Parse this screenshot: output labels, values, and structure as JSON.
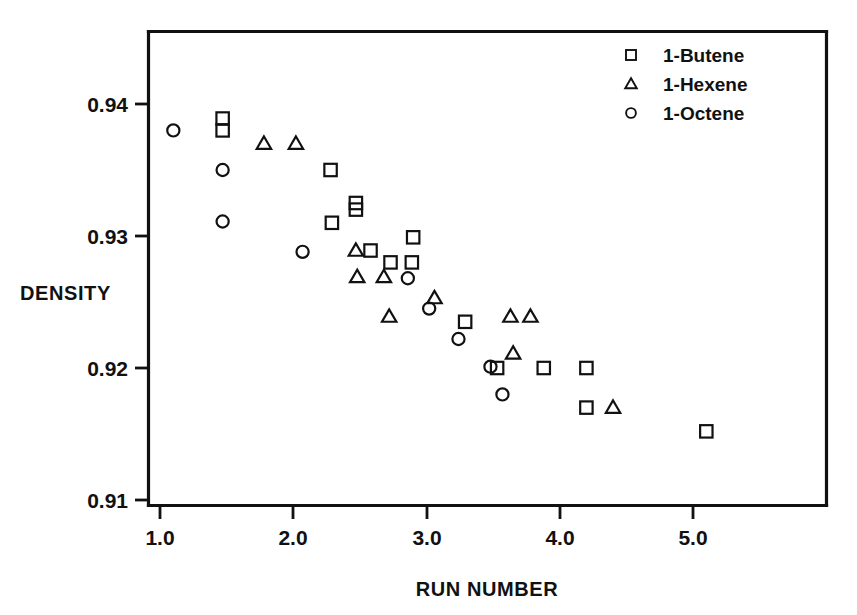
{
  "chart_data": {
    "type": "scatter",
    "title": "",
    "xlabel": "RUN NUMBER",
    "ylabel": "DENSITY",
    "xlim": [
      0.88,
      5.95
    ],
    "ylim": [
      0.9055,
      0.9425
    ],
    "xticks": [
      "1.0",
      "2.0",
      "3.0",
      "4.0",
      "5.0"
    ],
    "xtick_values": [
      1.0,
      2.0,
      3.0,
      4.0,
      5.0
    ],
    "yticks": [
      "0.94",
      "0.93",
      "0.92",
      "0.91"
    ],
    "ytick_values": [
      0.94,
      0.93,
      0.92,
      0.91
    ],
    "grid": false,
    "legend_position": "top-right",
    "series": [
      {
        "name": "1-Butene",
        "marker": "square",
        "points": [
          {
            "x": 1.47,
            "y": 0.9389
          },
          {
            "x": 1.47,
            "y": 0.938
          },
          {
            "x": 2.28,
            "y": 0.935
          },
          {
            "x": 2.29,
            "y": 0.931
          },
          {
            "x": 2.47,
            "y": 0.9325
          },
          {
            "x": 2.47,
            "y": 0.932
          },
          {
            "x": 2.58,
            "y": 0.9289
          },
          {
            "x": 2.73,
            "y": 0.928
          },
          {
            "x": 2.9,
            "y": 0.9299
          },
          {
            "x": 2.89,
            "y": 0.928
          },
          {
            "x": 3.29,
            "y": 0.9235
          },
          {
            "x": 3.53,
            "y": 0.92
          },
          {
            "x": 3.88,
            "y": 0.92
          },
          {
            "x": 4.2,
            "y": 0.92
          },
          {
            "x": 4.2,
            "y": 0.917
          },
          {
            "x": 5.1,
            "y": 0.9152
          }
        ]
      },
      {
        "name": "1-Hexene",
        "marker": "triangle",
        "points": [
          {
            "x": 1.78,
            "y": 0.937
          },
          {
            "x": 2.02,
            "y": 0.937
          },
          {
            "x": 2.47,
            "y": 0.9289
          },
          {
            "x": 2.48,
            "y": 0.9269
          },
          {
            "x": 2.68,
            "y": 0.9269
          },
          {
            "x": 2.72,
            "y": 0.9239
          },
          {
            "x": 3.06,
            "y": 0.9253
          },
          {
            "x": 3.63,
            "y": 0.9239
          },
          {
            "x": 3.65,
            "y": 0.9211
          },
          {
            "x": 3.78,
            "y": 0.9239
          },
          {
            "x": 4.4,
            "y": 0.917
          }
        ]
      },
      {
        "name": "1-Octene",
        "marker": "circle",
        "points": [
          {
            "x": 1.1,
            "y": 0.938
          },
          {
            "x": 1.47,
            "y": 0.935
          },
          {
            "x": 1.47,
            "y": 0.9311
          },
          {
            "x": 2.07,
            "y": 0.9288
          },
          {
            "x": 2.86,
            "y": 0.9268
          },
          {
            "x": 3.02,
            "y": 0.9245
          },
          {
            "x": 3.24,
            "y": 0.9222
          },
          {
            "x": 3.48,
            "y": 0.9201
          },
          {
            "x": 3.57,
            "y": 0.918
          }
        ]
      }
    ]
  },
  "legend": {
    "entries": [
      {
        "label": "1-Butene",
        "marker": "square"
      },
      {
        "label": "1-Hexene",
        "marker": "triangle"
      },
      {
        "label": "1-Octene",
        "marker": "circle"
      }
    ]
  },
  "colors": {
    "ink": "#111111",
    "background": "#ffffff"
  }
}
